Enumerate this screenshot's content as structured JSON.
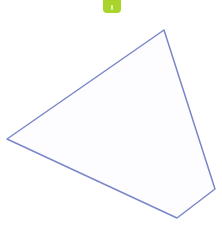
{
  "handle": {
    "color": "#a9d42c",
    "icon": "grip-handle-icon"
  },
  "shape": {
    "type": "polygon",
    "stroke": "#7b86c9",
    "fill": "#fdfdff",
    "stroke_width": 1.5,
    "points": "164,30 7,139 177,218 215,189"
  }
}
